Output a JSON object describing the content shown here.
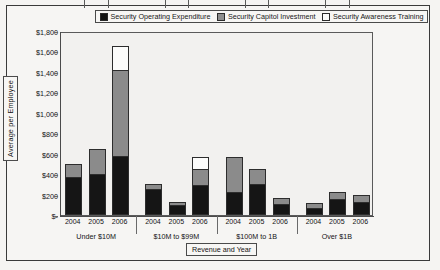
{
  "chart_data": {
    "type": "bar",
    "subtype": "stacked-grouped",
    "title": "",
    "xlabel": "Revenue and Year",
    "ylabel": "Average per Employee",
    "ylim": [
      0,
      1800
    ],
    "ytick_labels": [
      "$1,800",
      "$1,600",
      "$1,400",
      "$1,200",
      "$1,000",
      "$800",
      "$600",
      "$400",
      "$200",
      "$-"
    ],
    "ytick_values": [
      1800,
      1600,
      1400,
      1200,
      1000,
      800,
      600,
      400,
      200,
      0
    ],
    "grid": false,
    "legend_position": "top",
    "legend": [
      {
        "label": "Security Operating Expenditure",
        "color": "#151515"
      },
      {
        "label": "Security Capitol Investment",
        "color": "#8b8b8b"
      },
      {
        "label": "Security Awareness Training",
        "color": "#fcfcfb"
      }
    ],
    "categories": [
      "2004",
      "2005",
      "2006",
      "2004",
      "2005",
      "2006",
      "2004",
      "2005",
      "2006",
      "2004",
      "2005",
      "2006"
    ],
    "groups": [
      {
        "label": "Under $10M",
        "years": [
          "2004",
          "2005",
          "2006"
        ]
      },
      {
        "label": "$10M to $99M",
        "years": [
          "2004",
          "2005",
          "2006"
        ]
      },
      {
        "label": "$100M to 1B",
        "years": [
          "2004",
          "2005",
          "2006"
        ]
      },
      {
        "label": "Over $1B",
        "years": [
          "2004",
          "2005",
          "2006"
        ]
      }
    ],
    "series": [
      {
        "name": "Security Operating Expenditure",
        "values": [
          370,
          400,
          580,
          250,
          100,
          290,
          230,
          300,
          110,
          70,
          155,
          130
        ]
      },
      {
        "name": "Security Capitol Investment",
        "values": [
          130,
          250,
          840,
          55,
          30,
          160,
          340,
          150,
          55,
          50,
          75,
          65
        ]
      },
      {
        "name": "Security Awareness Training",
        "values": [
          0,
          0,
          230,
          0,
          0,
          120,
          0,
          0,
          0,
          0,
          0,
          0
        ]
      }
    ],
    "totals": [
      500,
      650,
      1650,
      305,
      130,
      570,
      570,
      450,
      165,
      120,
      230,
      195
    ]
  },
  "ghost_text": {
    "lines": [
      "to interpret the",
      "of security",
      "of the data in",
      "averages",
      "to be used",
      "considered to",
      "the measure of",
      "report to",
      "data and",
      "the analysis of"
    ]
  }
}
